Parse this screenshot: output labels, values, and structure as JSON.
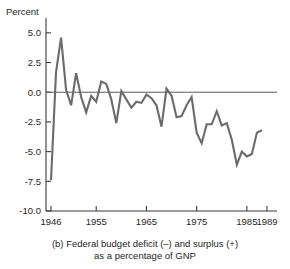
{
  "ylabel_text": "Percent",
  "caption": {
    "line1": "(b) Federal budget deficit (–) and surplus (+)",
    "line2": "as a percentage of GNP"
  },
  "style": {
    "line_color": "#6b6b6b",
    "axis_color": "#3a3a3a",
    "zero_line_color": "#5a5a5a",
    "text_color": "#262626",
    "background": "#ffffff"
  },
  "chart_data": {
    "type": "line",
    "title": "(b) Federal budget deficit (–) and surplus (+) as a percentage of GNP",
    "xlabel": "",
    "ylabel": "Percent",
    "xlim": [
      1945,
      1991
    ],
    "ylim": [
      -10.0,
      6.25
    ],
    "yticks": [
      5.0,
      2.5,
      0.0,
      -2.5,
      -5.0,
      -7.5,
      -10.0
    ],
    "ytick_labels": [
      "5.0",
      "2.5",
      "0.0",
      "-2.5",
      "-5.0",
      "-7.5",
      "-10.0"
    ],
    "xticks": [
      1946,
      1955,
      1965,
      1975,
      1985,
      1989
    ],
    "xtick_labels": [
      "1946",
      "1955",
      "1965",
      "1975",
      "1985",
      "1989"
    ],
    "grid": false,
    "legend": null,
    "zero_reference_line": 0.0,
    "series": [
      {
        "name": "Federal budget deficit (-) / surplus (+) as % of GNP",
        "x": [
          1946,
          1947,
          1948,
          1949,
          1950,
          1951,
          1952,
          1953,
          1954,
          1955,
          1956,
          1957,
          1958,
          1959,
          1960,
          1961,
          1962,
          1963,
          1964,
          1965,
          1966,
          1967,
          1968,
          1969,
          1970,
          1971,
          1972,
          1973,
          1974,
          1975,
          1976,
          1977,
          1978,
          1979,
          1980,
          1981,
          1982,
          1983,
          1984,
          1985,
          1986,
          1987,
          1988
        ],
        "y": [
          -7.4,
          1.7,
          4.6,
          0.2,
          -1.1,
          1.6,
          -0.4,
          -1.7,
          -0.3,
          -0.8,
          0.9,
          0.7,
          -0.6,
          -2.6,
          0.1,
          -0.6,
          -1.3,
          -0.8,
          -0.9,
          -0.2,
          -0.5,
          -1.1,
          -2.9,
          0.3,
          -0.3,
          -2.1,
          -2.0,
          -1.1,
          -0.4,
          -3.4,
          -4.3,
          -2.7,
          -2.7,
          -1.6,
          -2.8,
          -2.6,
          -4.0,
          -6.1,
          -5.0,
          -5.4,
          -5.2,
          -3.4,
          -3.2
        ]
      }
    ]
  }
}
